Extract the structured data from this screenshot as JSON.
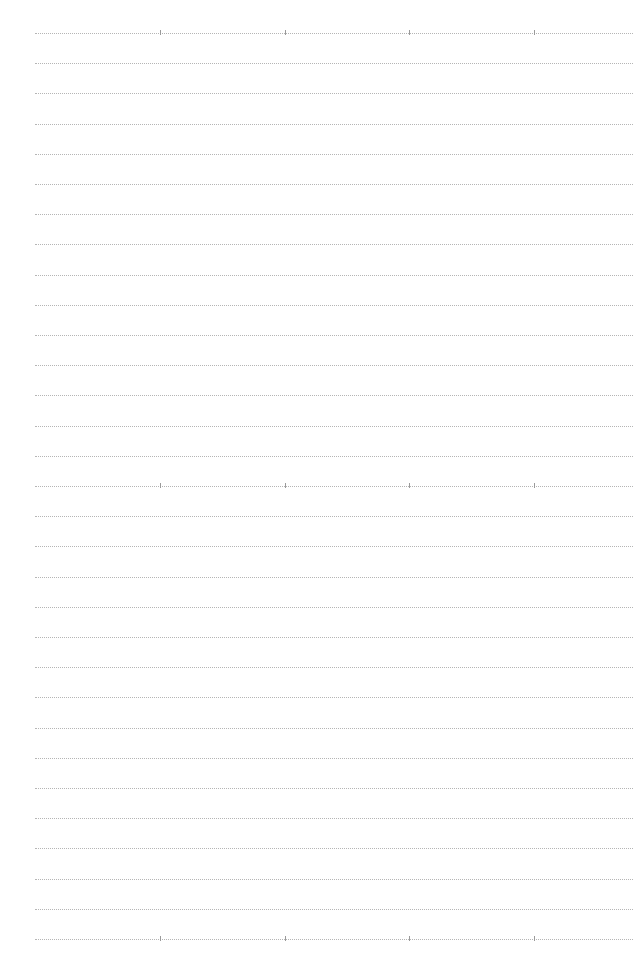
{
  "page": {
    "type": "dotted-lined-paper",
    "background_color": "#ffffff",
    "line_color": "#b5b5b5",
    "tick_color": "#9a9a9a",
    "line_count": 31,
    "first_line_y": 33,
    "line_spacing": 30.2,
    "line_start_x": 35,
    "tick_rows": [
      0,
      15,
      30
    ],
    "tick_x_positions": [
      160,
      285,
      409,
      534
    ]
  }
}
